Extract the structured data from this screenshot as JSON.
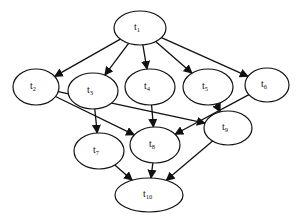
{
  "diagram": {
    "type": "task-dag",
    "nodes": [
      {
        "id": "t1",
        "label": "t",
        "sub": "1",
        "cx": 140,
        "cy": 28,
        "rx": 26,
        "ry": 17
      },
      {
        "id": "t2",
        "label": "t",
        "sub": "2",
        "cx": 36,
        "cy": 87,
        "rx": 23,
        "ry": 18
      },
      {
        "id": "t3",
        "label": "t",
        "sub": "3",
        "cx": 93,
        "cy": 91,
        "rx": 25,
        "ry": 18
      },
      {
        "id": "t4",
        "label": "t",
        "sub": "4",
        "cx": 150,
        "cy": 87,
        "rx": 25,
        "ry": 18
      },
      {
        "id": "t5",
        "label": "t",
        "sub": "5",
        "cx": 208,
        "cy": 87,
        "rx": 25,
        "ry": 18
      },
      {
        "id": "t6",
        "label": "t",
        "sub": "6",
        "cx": 267,
        "cy": 85,
        "rx": 22,
        "ry": 17
      },
      {
        "id": "t7",
        "label": "t",
        "sub": "7",
        "cx": 99,
        "cy": 151,
        "rx": 25,
        "ry": 18
      },
      {
        "id": "t8",
        "label": "t",
        "sub": "8",
        "cx": 155,
        "cy": 145,
        "rx": 25,
        "ry": 18
      },
      {
        "id": "t9",
        "label": "t",
        "sub": "9",
        "cx": 228,
        "cy": 128,
        "rx": 24,
        "ry": 17
      },
      {
        "id": "t10",
        "label": "t",
        "sub": "10",
        "cx": 149,
        "cy": 195,
        "rx": 34,
        "ry": 17
      }
    ],
    "edges": [
      {
        "from": "t1",
        "to": "t2"
      },
      {
        "from": "t1",
        "to": "t3"
      },
      {
        "from": "t1",
        "to": "t4"
      },
      {
        "from": "t1",
        "to": "t5"
      },
      {
        "from": "t1",
        "to": "t6"
      },
      {
        "from": "t2",
        "to": "t8"
      },
      {
        "from": "t2",
        "to": "t9"
      },
      {
        "from": "t3",
        "to": "t7"
      },
      {
        "from": "t4",
        "to": "t8"
      },
      {
        "from": "t5",
        "to": "t9"
      },
      {
        "from": "t6",
        "to": "t8"
      },
      {
        "from": "t7",
        "to": "t10"
      },
      {
        "from": "t8",
        "to": "t10"
      },
      {
        "from": "t9",
        "to": "t10"
      }
    ]
  }
}
